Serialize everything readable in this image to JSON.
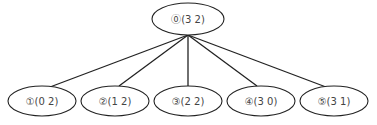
{
  "diagram": {
    "type": "tree",
    "root": {
      "id": "node-0",
      "label": "⓪(3 2)",
      "cx": 188,
      "cy": 19,
      "rx": 36,
      "ry": 16
    },
    "children": [
      {
        "id": "node-1",
        "label": "①(0 2)",
        "cx": 42,
        "cy": 101,
        "rx": 34,
        "ry": 15
      },
      {
        "id": "node-2",
        "label": "②(1 2)",
        "cx": 115,
        "cy": 101,
        "rx": 34,
        "ry": 15
      },
      {
        "id": "node-3",
        "label": "③(2 2)",
        "cx": 188,
        "cy": 101,
        "rx": 34,
        "ry": 15
      },
      {
        "id": "node-4",
        "label": "④(3 0)",
        "cx": 261,
        "cy": 101,
        "rx": 34,
        "ry": 15
      },
      {
        "id": "node-5",
        "label": "⑤(3 1)",
        "cx": 334,
        "cy": 101,
        "rx": 34,
        "ry": 15
      }
    ],
    "edges": [
      {
        "from": "node-0",
        "to": "node-1"
      },
      {
        "from": "node-0",
        "to": "node-2"
      },
      {
        "from": "node-0",
        "to": "node-3"
      },
      {
        "from": "node-0",
        "to": "node-4"
      },
      {
        "from": "node-0",
        "to": "node-5"
      }
    ],
    "colors": {
      "stroke": "#222222",
      "text": "#444444",
      "background": "#ffffff"
    }
  }
}
